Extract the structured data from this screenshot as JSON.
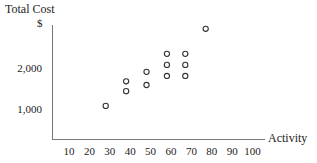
{
  "chart_data": {
    "type": "scatter",
    "title": "Total Cost",
    "ylabel": "Total Cost",
    "yunit": "$",
    "xlabel": "Activity",
    "x_ticks": [
      10,
      20,
      30,
      40,
      50,
      60,
      70,
      80,
      90,
      100
    ],
    "y_ticks": [
      "1,000",
      "2,000"
    ],
    "y_tick_values": [
      1000,
      2000
    ],
    "grid": false,
    "legend": null,
    "points": [
      {
        "x": 28,
        "y": 1100
      },
      {
        "x": 38,
        "y": 1460
      },
      {
        "x": 38,
        "y": 1700
      },
      {
        "x": 48,
        "y": 1610
      },
      {
        "x": 48,
        "y": 1930
      },
      {
        "x": 58,
        "y": 1830
      },
      {
        "x": 58,
        "y": 2100
      },
      {
        "x": 58,
        "y": 2370
      },
      {
        "x": 67,
        "y": 1830
      },
      {
        "x": 67,
        "y": 2100
      },
      {
        "x": 67,
        "y": 2370
      },
      {
        "x": 77,
        "y": 2980
      }
    ]
  },
  "labels": {
    "title": "Total Cost",
    "unit": "$",
    "xlabel": "Activity",
    "y_1000": "1,000",
    "y_2000": "2,000",
    "x": [
      "10",
      "20",
      "30",
      "40",
      "50",
      "60",
      "70",
      "80",
      "90",
      "100"
    ]
  }
}
